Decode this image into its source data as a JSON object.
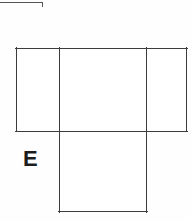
{
  "figure": {
    "kind": "geometry-net-diagram",
    "background_color": "#fefefe",
    "line_color": "#3c3c3c",
    "label_color": "#1c1c1c",
    "crop_mark_color": "#555555",
    "labels": [
      {
        "id": "E",
        "text": "E",
        "x": 23,
        "y": 148,
        "font_size": 22,
        "bold": true
      }
    ],
    "faces": [
      {
        "name": "left-face",
        "x": 16,
        "y": 48,
        "width": 43,
        "height": 83
      },
      {
        "name": "middle-face",
        "x": 59,
        "y": 48,
        "width": 88,
        "height": 83
      },
      {
        "name": "right-face",
        "x": 147,
        "y": 48,
        "width": 40,
        "height": 83
      },
      {
        "name": "bottom-face",
        "x": 59,
        "y": 131,
        "width": 88,
        "height": 81
      }
    ],
    "segments": [
      {
        "name": "band-top-edge",
        "x1": 16,
        "y1": 48,
        "x2": 187,
        "y2": 48
      },
      {
        "name": "band-bottom-edge",
        "x1": 16,
        "y1": 131,
        "x2": 187,
        "y2": 131
      },
      {
        "name": "band-left-edge",
        "x1": 16,
        "y1": 48,
        "x2": 16,
        "y2": 131
      },
      {
        "name": "band-right-edge",
        "x1": 187,
        "y1": 48,
        "x2": 187,
        "y2": 131
      },
      {
        "name": "fold-line-left",
        "x1": 59,
        "y1": 48,
        "x2": 59,
        "y2": 131
      },
      {
        "name": "fold-line-right",
        "x1": 147,
        "y1": 48,
        "x2": 147,
        "y2": 131
      },
      {
        "name": "bottom-face-left",
        "x1": 59,
        "y1": 131,
        "x2": 59,
        "y2": 212
      },
      {
        "name": "bottom-face-right",
        "x1": 147,
        "y1": 131,
        "x2": 147,
        "y2": 212
      },
      {
        "name": "bottom-face-bottom",
        "x1": 59,
        "y1": 212,
        "x2": 147,
        "y2": 212
      }
    ],
    "crop_marks": [
      {
        "name": "top-horizontal-rule",
        "x1": 0,
        "y1": 2,
        "x2": 43,
        "y2": 2
      },
      {
        "name": "top-vertical-tick",
        "x1": 43,
        "y1": 2,
        "x2": 43,
        "y2": 7
      }
    ]
  }
}
